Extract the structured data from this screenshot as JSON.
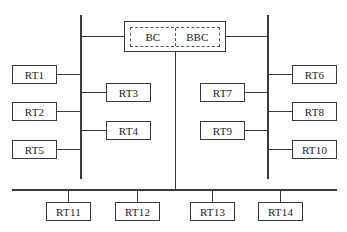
{
  "diagram": {
    "type": "bus-topology",
    "controller": {
      "labels": [
        "BC",
        "BBC"
      ],
      "bc_label": "BC",
      "bbc_label": "BBC"
    },
    "buses": {
      "left_vertical": "left bus",
      "right_vertical": "right bus",
      "bottom_horizontal": "bottom bus"
    },
    "terminals": {
      "rt1": "RT1",
      "rt2": "RT2",
      "rt3": "RT3",
      "rt4": "RT4",
      "rt5": "RT5",
      "rt6": "RT6",
      "rt7": "RT7",
      "rt8": "RT8",
      "rt9": "RT9",
      "rt10": "RT10",
      "rt11": "RT11",
      "rt12": "RT12",
      "rt13": "RT13",
      "rt14": "RT14"
    },
    "connections": [
      {
        "from": "BC",
        "to": "left bus"
      },
      {
        "from": "BBC",
        "to": "right bus"
      },
      {
        "from": "BC/BBC",
        "to": "bottom bus"
      },
      {
        "from": "RT1",
        "to": "left bus"
      },
      {
        "from": "RT2",
        "to": "left bus"
      },
      {
        "from": "RT3",
        "to": "left bus"
      },
      {
        "from": "RT4",
        "to": "left bus"
      },
      {
        "from": "RT5",
        "to": "left bus"
      },
      {
        "from": "RT6",
        "to": "right bus"
      },
      {
        "from": "RT7",
        "to": "right bus"
      },
      {
        "from": "RT8",
        "to": "right bus"
      },
      {
        "from": "RT9",
        "to": "right bus"
      },
      {
        "from": "RT10",
        "to": "right bus"
      },
      {
        "from": "RT11",
        "to": "bottom bus"
      },
      {
        "from": "RT12",
        "to": "bottom bus"
      },
      {
        "from": "RT13",
        "to": "bottom bus"
      },
      {
        "from": "RT14",
        "to": "bottom bus"
      }
    ]
  }
}
